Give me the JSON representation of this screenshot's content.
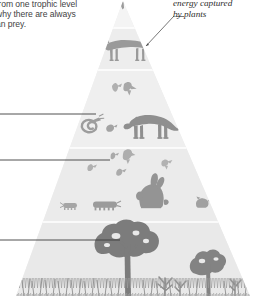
{
  "figure": {
    "type": "energy-pyramid-diagram",
    "background_color": "#ffffff"
  },
  "annotations": {
    "left_caption": {
      "name": "trophic-level-caption",
      "lines": [
        "from one trophic level",
        "why there are always",
        "an prey."
      ]
    },
    "right_caption": {
      "name": "energy-captured-caption",
      "lines": [
        "energy captured",
        "by plants"
      ]
    }
  },
  "leader_lines": [
    {
      "name": "leader-line-secondary-consumers",
      "y": 114,
      "x_start": 0,
      "x_end": 96
    },
    {
      "name": "leader-line-primary-consumers",
      "y": 160,
      "x_start": 0,
      "x_end": 110
    },
    {
      "name": "leader-line-producers",
      "y": 240,
      "x_start": 0,
      "x_end": 120
    }
  ],
  "pointer_line": {
    "name": "pointer-line-energy-captured",
    "x_start": 174,
    "y_start": 16,
    "x_end": 146,
    "y_end": 46
  },
  "pyramid": {
    "apex_x": 123,
    "apex_y": 1,
    "base_left_x": 16,
    "base_right_x": 250,
    "base_y": 296,
    "fill_color": "#ededed",
    "divider_color": "#ffffff",
    "tiers": [
      {
        "name": "tier-apex",
        "label": "apex",
        "y_top": 1,
        "y_bottom": 28,
        "fill": "#f2f2f2",
        "organisms": []
      },
      {
        "name": "tier-tertiary-consumers",
        "label": "tertiary consumers",
        "y_top": 28,
        "y_bottom": 70,
        "fill": "#ececec",
        "organisms": [
          "fox"
        ]
      },
      {
        "name": "tier-secondary-consumers",
        "label": "secondary consumers",
        "y_top": 70,
        "y_bottom": 148,
        "fill": "#eeeeee",
        "organisms": [
          "hawk",
          "bird",
          "snake",
          "frog",
          "badger"
        ]
      },
      {
        "name": "tier-primary-consumers",
        "label": "primary consumers",
        "y_top": 148,
        "y_bottom": 222,
        "fill": "#ebebeb",
        "organisms": [
          "small-bird",
          "sparrow",
          "finch",
          "rabbit",
          "mouse",
          "caterpillar",
          "beetle"
        ]
      },
      {
        "name": "tier-producers",
        "label": "producers",
        "y_top": 222,
        "y_bottom": 296,
        "fill": "#e9e9e9",
        "organisms": [
          "large-tree",
          "small-tree",
          "grass",
          "shrubs"
        ]
      }
    ]
  },
  "colors": {
    "silhouette_dark": "#8e8e8e",
    "silhouette_mid": "#a5a5a5",
    "silhouette_light": "#b8b8b8",
    "tree_color": "#7f7f7f",
    "grass_color": "#999999",
    "line_color": "#444444",
    "text_color": "#3f3f3f"
  }
}
